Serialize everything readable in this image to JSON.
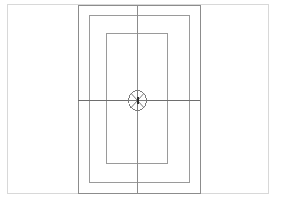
{
  "document": {
    "type": "technical-line-drawing",
    "title": "Nested rectangular frames with centered spoked rosette",
    "background_color": "#ffffff"
  },
  "page_border": {
    "name": "page-border",
    "x": 7,
    "y": 4,
    "width": 261,
    "height": 189,
    "stroke": "#d8d8d8",
    "stroke_width": 1
  },
  "frames": [
    {
      "label": "outer-frame",
      "x": 78,
      "y": 5,
      "width": 122,
      "height": 188,
      "stroke": "#8c8c8c",
      "stroke_width": 1
    },
    {
      "label": "middle-frame",
      "x": 89,
      "y": 15,
      "width": 100,
      "height": 167,
      "stroke": "#9a9a9a",
      "stroke_width": 1
    },
    {
      "label": "inner-frame",
      "x": 106,
      "y": 33,
      "width": 61,
      "height": 130,
      "stroke": "#9a9a9a",
      "stroke_width": 1
    }
  ],
  "axes": {
    "vertical_centerline": {
      "label": "vertical-centerline",
      "x": 137,
      "y1": 5,
      "y2": 193,
      "stroke": "#8c8c8c",
      "stroke_width": 1
    },
    "horizontal_centerline": {
      "label": "horizontal-centerline",
      "y": 100,
      "x1": 78,
      "x2": 200,
      "stroke": "#6e6e6e",
      "stroke_width": 1
    }
  },
  "rosette": {
    "label": "spoked-rosette",
    "center_x": 137,
    "center_y": 100,
    "radius_x": 9,
    "radius_y": 10,
    "stroke": "#7a7a7a",
    "stroke_width": 1,
    "spoke_count": 8,
    "spoke_angles_deg": [
      0,
      45,
      90,
      135,
      180,
      225,
      270,
      315
    ],
    "hub": {
      "label": "rosette-hub",
      "width": 2,
      "height": 7,
      "fill": "#2e2e2e"
    }
  },
  "colors": {
    "paper": "#ffffff",
    "border_light": "#d8d8d8",
    "line_mid": "#9a9a9a",
    "line_dark": "#6e6e6e",
    "hub_dark": "#2e2e2e"
  }
}
